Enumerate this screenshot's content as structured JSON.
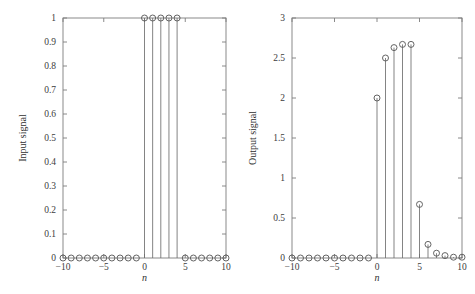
{
  "figure": {
    "background_color": "#ffffff",
    "axis_color": "#7d7d7d",
    "stem_color": "#6e6e6e",
    "marker_color": "#5c5c5c",
    "width": 475,
    "height": 294
  },
  "chart_data": [
    {
      "type": "scatter",
      "plot_style": "stem",
      "panel": "left",
      "title": "",
      "xlabel": "n",
      "ylabel": "Input signal",
      "xlim": [
        -10,
        10
      ],
      "ylim": [
        0,
        1
      ],
      "grid": false,
      "legend": null,
      "xticks": [
        -10,
        -5,
        0,
        5,
        10
      ],
      "xticklabels": [
        "−10",
        "−5",
        "0",
        "5",
        "10"
      ],
      "yticks": [
        0,
        0.1,
        0.2,
        0.3,
        0.4,
        0.5,
        0.6,
        0.7,
        0.8,
        0.9,
        1
      ],
      "yticklabels": [
        "0",
        "0.1",
        "0.2",
        "0.3",
        "0.4",
        "0.5",
        "0.6",
        "0.7",
        "0.8",
        "0.9",
        "1"
      ],
      "x": [
        -10,
        -9,
        -8,
        -7,
        -6,
        -5,
        -4,
        -3,
        -2,
        -1,
        0,
        1,
        2,
        3,
        4,
        5,
        6,
        7,
        8,
        9,
        10
      ],
      "values": [
        0,
        0,
        0,
        0,
        0,
        0,
        0,
        0,
        0,
        0,
        1,
        1,
        1,
        1,
        1,
        0,
        0,
        0,
        0,
        0,
        0
      ]
    },
    {
      "type": "scatter",
      "plot_style": "stem",
      "panel": "right",
      "title": "",
      "xlabel": "n",
      "ylabel": "Output signal",
      "xlim": [
        -10,
        10
      ],
      "ylim": [
        0,
        3
      ],
      "grid": false,
      "legend": null,
      "xticks": [
        -10,
        -5,
        0,
        5,
        10
      ],
      "xticklabels": [
        "−10",
        "−5",
        "0",
        "5",
        "10"
      ],
      "yticks": [
        0,
        0.5,
        1,
        1.5,
        2,
        2.5,
        3
      ],
      "yticklabels": [
        "0",
        "0.5",
        "1",
        "1.5",
        "2",
        "2.5",
        "3"
      ],
      "x": [
        -10,
        -9,
        -8,
        -7,
        -6,
        -5,
        -4,
        -3,
        -2,
        -1,
        0,
        1,
        2,
        3,
        4,
        5,
        6,
        7,
        8,
        9,
        10
      ],
      "values": [
        0,
        0,
        0,
        0,
        0,
        0,
        0,
        0,
        0,
        0,
        2.0,
        2.5,
        2.63,
        2.67,
        2.67,
        0.67,
        0.17,
        0.06,
        0.03,
        0.01,
        0.01
      ]
    }
  ]
}
